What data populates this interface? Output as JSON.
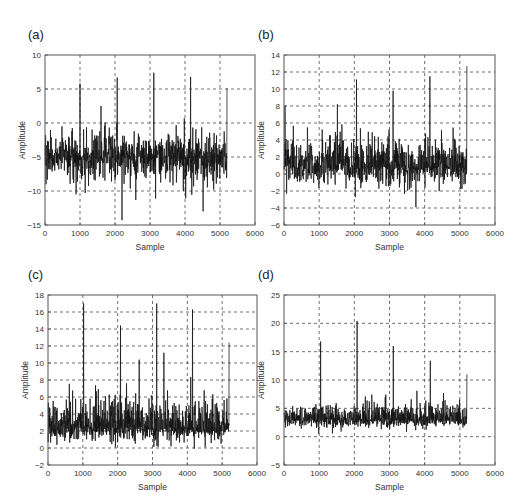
{
  "figure": {
    "panels": [
      {
        "id": "a",
        "label": "(a)"
      },
      {
        "id": "b",
        "label": "(b)"
      },
      {
        "id": "c",
        "label": "(c)"
      },
      {
        "id": "d",
        "label": "(d)"
      }
    ]
  },
  "chart_data": [
    {
      "type": "line",
      "panel": "(a)",
      "title": "",
      "xlabel": "Sample",
      "ylabel": "Amplitude",
      "xlim": [
        0,
        6000
      ],
      "ylim": [
        -15,
        10
      ],
      "xticks": [
        0,
        1000,
        2000,
        3000,
        4000,
        5000,
        6000
      ],
      "yticks": [
        -15,
        -10,
        -5,
        0,
        5,
        10
      ],
      "grid": true,
      "grid_style": "dashed",
      "series": [
        {
          "name": "signal",
          "n_samples": 5200,
          "baseline_mean": -5,
          "noise_range": [
            -13,
            2
          ],
          "peaks": [
            {
              "x": 1000,
              "y": 5.8
            },
            {
              "x": 1600,
              "y": 2.5
            },
            {
              "x": 2060,
              "y": 6.7
            },
            {
              "x": 2200,
              "y": -14.3
            },
            {
              "x": 3110,
              "y": 7.4
            },
            {
              "x": 4160,
              "y": 6.8
            },
            {
              "x": 4520,
              "y": -13.0
            },
            {
              "x": 5200,
              "y": 5.1
            }
          ]
        }
      ]
    },
    {
      "type": "line",
      "panel": "(b)",
      "title": "",
      "xlabel": "Sample",
      "ylabel": "Amplitude",
      "xlim": [
        0,
        6000
      ],
      "ylim": [
        -6,
        14
      ],
      "xticks": [
        0,
        1000,
        2000,
        3000,
        4000,
        5000,
        6000
      ],
      "yticks": [
        -6,
        -4,
        -2,
        0,
        2,
        4,
        6,
        8,
        10,
        12,
        14
      ],
      "grid": true,
      "grid_style": "dashed",
      "series": [
        {
          "name": "signal",
          "n_samples": 5200,
          "baseline_mean": 1,
          "noise_range": [
            -3.8,
            8
          ],
          "peaks": [
            {
              "x": 30,
              "y": 8.0
            },
            {
              "x": 1520,
              "y": 8.2
            },
            {
              "x": 2060,
              "y": 11.1
            },
            {
              "x": 3100,
              "y": 9.8
            },
            {
              "x": 3750,
              "y": -3.9
            },
            {
              "x": 4150,
              "y": 11.5
            },
            {
              "x": 5200,
              "y": 12.7
            }
          ]
        }
      ]
    },
    {
      "type": "line",
      "panel": "(c)",
      "title": "",
      "xlabel": "Sample",
      "ylabel": "Amplitude",
      "xlim": [
        0,
        6000
      ],
      "ylim": [
        -2,
        18
      ],
      "xticks": [
        0,
        1000,
        2000,
        3000,
        4000,
        5000,
        6000
      ],
      "yticks": [
        -2,
        0,
        2,
        4,
        6,
        8,
        10,
        12,
        14,
        16,
        18
      ],
      "grid": true,
      "grid_style": "dashed",
      "series": [
        {
          "name": "signal",
          "n_samples": 5200,
          "baseline_mean": 2.5,
          "noise_range": [
            -0.8,
            9
          ],
          "peaks": [
            {
              "x": 1020,
              "y": 17.0
            },
            {
              "x": 2080,
              "y": 14.4
            },
            {
              "x": 2620,
              "y": 10.4
            },
            {
              "x": 3120,
              "y": 17.0
            },
            {
              "x": 3330,
              "y": 11.2
            },
            {
              "x": 4150,
              "y": 16.3
            },
            {
              "x": 5200,
              "y": 12.4
            }
          ]
        }
      ]
    },
    {
      "type": "line",
      "panel": "(d)",
      "title": "",
      "xlabel": "Sample",
      "ylabel": "Amplitude",
      "xlim": [
        0,
        6000
      ],
      "ylim": [
        -5,
        25
      ],
      "xticks": [
        0,
        1000,
        2000,
        3000,
        4000,
        5000,
        6000
      ],
      "yticks": [
        -5,
        0,
        5,
        10,
        15,
        20,
        25
      ],
      "grid": true,
      "grid_style": "dashed",
      "series": [
        {
          "name": "signal",
          "n_samples": 5200,
          "baseline_mean": 3,
          "noise_range": [
            0,
            9
          ],
          "peaks": [
            {
              "x": 1040,
              "y": 16.8
            },
            {
              "x": 2080,
              "y": 20.4
            },
            {
              "x": 3110,
              "y": 16.0
            },
            {
              "x": 4160,
              "y": 13.4
            },
            {
              "x": 5200,
              "y": 11.0
            }
          ]
        }
      ]
    }
  ]
}
